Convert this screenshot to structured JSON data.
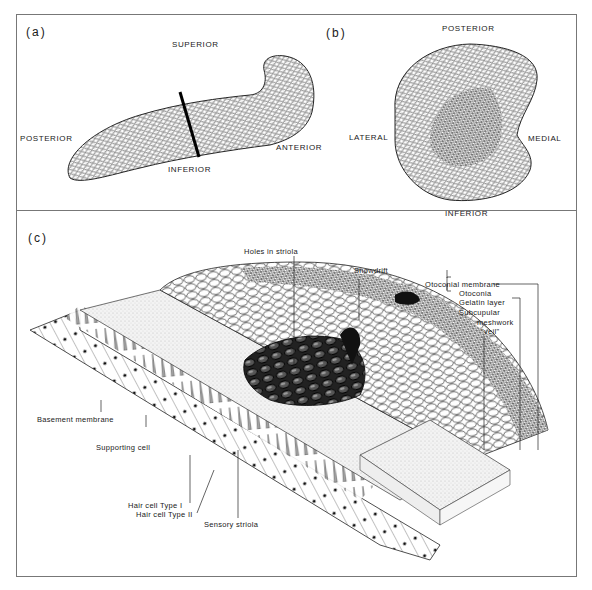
{
  "figure": {
    "panels": {
      "a": {
        "label": "(a)",
        "orientation": {
          "superior": "SUPERIOR",
          "posterior": "POSTERIOR",
          "anterior": "ANTERIOR",
          "inferior": "INFERIOR"
        }
      },
      "b": {
        "label": "(b)",
        "orientation": {
          "posterior": "POSTERIOR",
          "lateral": "LATERAL",
          "medial": "MEDIAL",
          "inferior": "INFERIOR"
        }
      },
      "c": {
        "label": "(c)",
        "annotations": {
          "holes_in_striola": "Holes in striola",
          "snowdrift": "Snowdrift",
          "otoconial_membrane": "Otoconial membrane",
          "otoconia": "Otoconia",
          "gelatin_layer": "Gelatin layer",
          "subcupular": "Subcupular",
          "meshwork": "meshwork",
          "veil": "\"veil\"",
          "basement_membrane": "Basement membrane",
          "supporting_cell": "Supporting cell",
          "hair_cell_type_1": "Hair cell Type I",
          "hair_cell_type_2": "Hair cell Type II",
          "sensory_striola": "Sensory striola"
        }
      }
    },
    "colors": {
      "ink": "#1a1a1a",
      "frame": "#777777",
      "background": "#ffffff"
    }
  }
}
